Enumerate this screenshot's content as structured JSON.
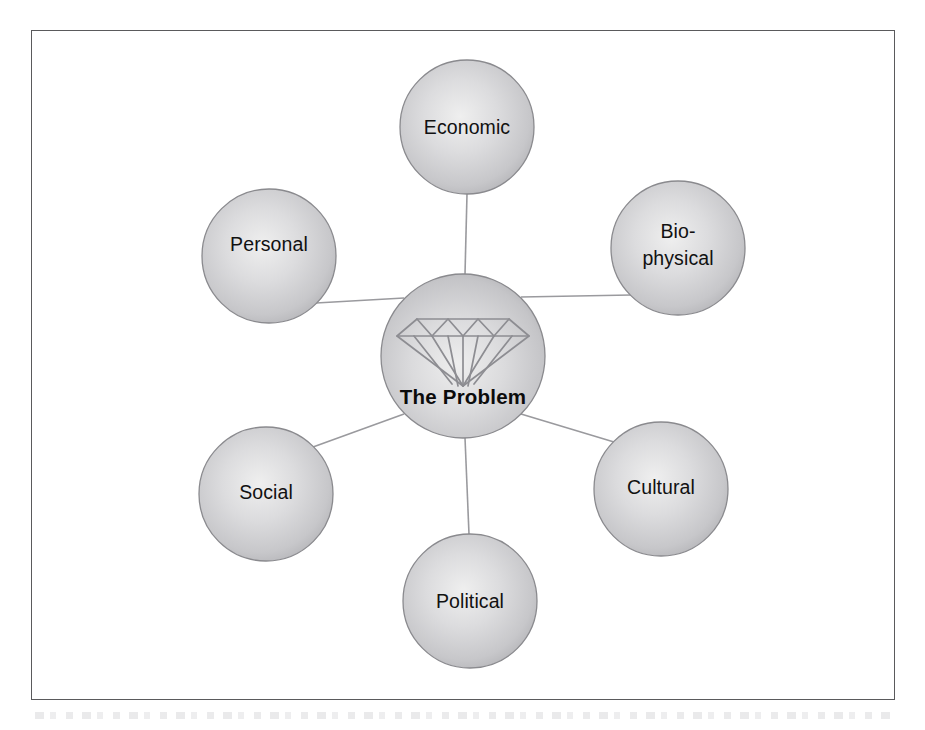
{
  "figure": {
    "frame": {
      "border_color": "#5a5a5c"
    },
    "hub": {
      "label": "The Problem",
      "icon": "diamond-icon",
      "cx": 463,
      "cy": 356,
      "r": 82
    },
    "nodes": [
      {
        "id": "economic",
        "label": "Economic",
        "lines": [
          "Economic"
        ],
        "cx": 467,
        "cy": 127,
        "r": 67
      },
      {
        "id": "biophysical",
        "label": "Bio-physical",
        "lines": [
          "Bio-",
          "physical"
        ],
        "cx": 678,
        "cy": 248,
        "r": 67
      },
      {
        "id": "cultural",
        "label": "Cultural",
        "lines": [
          "Cultural"
        ],
        "cx": 661,
        "cy": 489,
        "r": 67
      },
      {
        "id": "political",
        "label": "Political",
        "lines": [
          "Political"
        ],
        "cx": 470,
        "cy": 601,
        "r": 67
      },
      {
        "id": "social",
        "label": "Social",
        "lines": [
          "Social"
        ],
        "cx": 266,
        "cy": 494,
        "r": 67
      },
      {
        "id": "personal",
        "label": "Personal",
        "lines": [
          "Personal"
        ],
        "cx": 269,
        "cy": 256,
        "r": 67
      }
    ],
    "colors": {
      "sphere_highlight": "#ececed",
      "sphere_mid": "#cfcfd1",
      "sphere_edge": "#a9a9ad",
      "sphere_outline": "#8a8a8e",
      "connector": "#9a9a9e",
      "diamond_line": "#8d8d92",
      "label_text": "#111111",
      "frame": "#5a5a5c"
    }
  }
}
